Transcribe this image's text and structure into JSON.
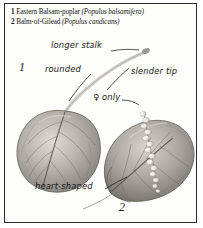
{
  "plate": {
    "border_color": "#2b2b2b",
    "background_color": "#fdfdfb"
  },
  "caption": {
    "entries": [
      {
        "number": "1",
        "common_name": "Eastern Balsam-poplar",
        "scientific_name": "(Populus balsamifera)"
      },
      {
        "number": "2",
        "common_name": "Balm-of-Gilead",
        "scientific_name": "(Populus candicans)"
      }
    ]
  },
  "figure_markers": [
    {
      "label": "1",
      "refers_to": "Eastern Balsam-poplar leaf"
    },
    {
      "label": "2",
      "refers_to": "Balm-of-Gilead leaf"
    }
  ],
  "annotations": [
    {
      "text": "longer stalk",
      "points_to": "petiole"
    },
    {
      "text": "rounded",
      "points_to": "leaf-base-1"
    },
    {
      "text": "slender tip",
      "points_to": "leaf-apex-1"
    },
    {
      "text": "♀ only",
      "points_to": "female-catkin"
    },
    {
      "text": "heart-shaped",
      "points_to": "leaf-base-2"
    }
  ],
  "illustration": {
    "style": "grayscale engraving",
    "subjects": [
      {
        "name": "leaf-1",
        "description": "rounded ovate balsam-poplar leaf with slender tip and pinnate veins"
      },
      {
        "name": "leaf-2",
        "description": "broad heart-shaped balm-of-gilead leaf"
      },
      {
        "name": "catkin",
        "description": "pale female catkin lying across leaf 2"
      },
      {
        "name": "stalk",
        "description": "long pale curved petiole joining the two leaves"
      }
    ],
    "ink_color": "#6e6e6e",
    "leaf_light": "#cfcdc7",
    "leaf_mid": "#a7a49d",
    "leaf_dark": "#6b6862",
    "catkin_color": "#f2f1ec"
  }
}
